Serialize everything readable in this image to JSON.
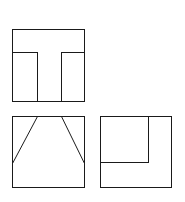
{
  "diagram": {
    "type": "orthographic-projection",
    "stroke_color": "#1a1a1a",
    "background": "#ffffff",
    "views": [
      {
        "name": "top-view",
        "outline": {
          "x": 12,
          "y": 29,
          "w": 72,
          "h": 72
        },
        "lines": [
          [
            12,
            52,
            37,
            52
          ],
          [
            37,
            52,
            37,
            101
          ],
          [
            61,
            52,
            84,
            52
          ],
          [
            61,
            52,
            61,
            101
          ]
        ]
      },
      {
        "name": "front-view",
        "outline": {
          "x": 12,
          "y": 116,
          "w": 72,
          "h": 71
        },
        "lines": [
          [
            37,
            116,
            12,
            163
          ],
          [
            61,
            116,
            84,
            163
          ]
        ]
      },
      {
        "name": "side-view",
        "outline": {
          "x": 100,
          "y": 116,
          "w": 71,
          "h": 71
        },
        "lines": [
          [
            148,
            116,
            148,
            162
          ],
          [
            100,
            162,
            148,
            162
          ]
        ]
      }
    ]
  }
}
